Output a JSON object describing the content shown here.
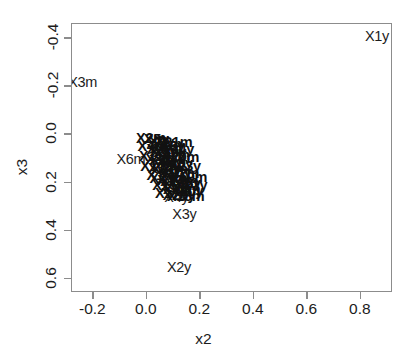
{
  "chart_data": {
    "type": "scatter",
    "title": "",
    "xlabel": "x2",
    "ylabel": "x3",
    "xlim": [
      -0.28,
      0.92
    ],
    "ylim": [
      0.66,
      -0.46
    ],
    "y_axis_inverted": true,
    "grid": false,
    "legend": "none",
    "point_marker": "text-label",
    "xticks": [
      "-0.2",
      "0.0",
      "0.2",
      "0.4",
      "0.6",
      "0.8"
    ],
    "xtick_values": [
      -0.2,
      0.0,
      0.2,
      0.4,
      0.6,
      0.8
    ],
    "yticks": [
      "-0.4",
      "-0.2",
      "0.0",
      "0.2",
      "0.4",
      "0.6"
    ],
    "ytick_values": [
      -0.4,
      -0.2,
      0.0,
      0.2,
      0.4,
      0.6
    ],
    "points": [
      {
        "label": "X1y",
        "x": 0.86,
        "y": -0.41,
        "outlier": true
      },
      {
        "label": "X3m",
        "x": -0.24,
        "y": -0.22,
        "outlier": true
      },
      {
        "label": "X2y",
        "x": 0.12,
        "y": 0.55,
        "outlier": true
      },
      {
        "label": "X3y",
        "x": 0.14,
        "y": 0.33,
        "outlier": true
      },
      {
        "label": "X4y",
        "x": 0.11,
        "y": 0.26,
        "outlier": true
      },
      {
        "label": "X6m",
        "x": -0.06,
        "y": 0.1,
        "outlier": true
      },
      {
        "label": "X2m",
        "x": 0.015,
        "y": 0.015,
        "outlier": false
      },
      {
        "label": "X5y",
        "x": 0.035,
        "y": 0.02,
        "outlier": false
      },
      {
        "label": "X7y",
        "x": 0.055,
        "y": 0.03,
        "outlier": false
      },
      {
        "label": "X1m",
        "x": 0.075,
        "y": 0.04,
        "outlier": false
      },
      {
        "label": "X8y",
        "x": 0.095,
        "y": 0.05,
        "outlier": false
      },
      {
        "label": "X4m",
        "x": 0.02,
        "y": 0.05,
        "outlier": false
      },
      {
        "label": "X9y",
        "x": 0.045,
        "y": 0.06,
        "outlier": false
      },
      {
        "label": "X5m",
        "x": 0.065,
        "y": 0.07,
        "outlier": false
      },
      {
        "label": "X10y",
        "x": 0.085,
        "y": 0.075,
        "outlier": false
      },
      {
        "label": "X7m",
        "x": 0.105,
        "y": 0.085,
        "outlier": false
      },
      {
        "label": "X11y",
        "x": 0.03,
        "y": 0.09,
        "outlier": false
      },
      {
        "label": "X8m",
        "x": 0.05,
        "y": 0.1,
        "outlier": false
      },
      {
        "label": "X12y",
        "x": 0.07,
        "y": 0.105,
        "outlier": false
      },
      {
        "label": "X9m",
        "x": 0.09,
        "y": 0.115,
        "outlier": false
      },
      {
        "label": "X13y",
        "x": 0.11,
        "y": 0.12,
        "outlier": false
      },
      {
        "label": "X10m",
        "x": 0.045,
        "y": 0.13,
        "outlier": false
      },
      {
        "label": "X14y",
        "x": 0.065,
        "y": 0.14,
        "outlier": false
      },
      {
        "label": "X11m",
        "x": 0.085,
        "y": 0.145,
        "outlier": false
      },
      {
        "label": "X15y",
        "x": 0.105,
        "y": 0.155,
        "outlier": false
      },
      {
        "label": "X12m",
        "x": 0.125,
        "y": 0.16,
        "outlier": false
      },
      {
        "label": "X16y",
        "x": 0.06,
        "y": 0.17,
        "outlier": false
      },
      {
        "label": "X13m",
        "x": 0.08,
        "y": 0.18,
        "outlier": false
      },
      {
        "label": "X17y",
        "x": 0.1,
        "y": 0.19,
        "outlier": false
      },
      {
        "label": "X14m",
        "x": 0.12,
        "y": 0.195,
        "outlier": false
      },
      {
        "label": "X18y",
        "x": 0.14,
        "y": 0.2,
        "outlier": false
      },
      {
        "label": "X15m",
        "x": 0.09,
        "y": 0.21,
        "outlier": false
      },
      {
        "label": "X19y",
        "x": 0.11,
        "y": 0.22,
        "outlier": false
      },
      {
        "label": "X16m",
        "x": 0.13,
        "y": 0.225,
        "outlier": false
      },
      {
        "label": "X20y",
        "x": 0.15,
        "y": 0.235,
        "outlier": false
      },
      {
        "label": "X17m",
        "x": 0.1,
        "y": 0.245,
        "outlier": false
      },
      {
        "label": "X21y",
        "x": 0.12,
        "y": 0.25,
        "outlier": false
      },
      {
        "label": "X18m",
        "x": 0.145,
        "y": 0.255,
        "outlier": false
      },
      {
        "label": "X22y",
        "x": 0.165,
        "y": 0.21,
        "outlier": false
      },
      {
        "label": "X19m",
        "x": 0.155,
        "y": 0.175,
        "outlier": false
      },
      {
        "label": "X23y",
        "x": 0.14,
        "y": 0.13,
        "outlier": false
      },
      {
        "label": "X20m",
        "x": 0.125,
        "y": 0.095,
        "outlier": false
      },
      {
        "label": "X24y",
        "x": 0.115,
        "y": 0.06,
        "outlier": false
      },
      {
        "label": "X21m",
        "x": 0.1,
        "y": 0.03,
        "outlier": false
      }
    ]
  }
}
